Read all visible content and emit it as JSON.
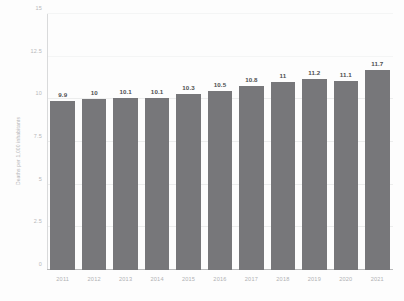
{
  "chart_data": {
    "type": "bar",
    "title": "",
    "subtitle": "",
    "xlabel": "",
    "ylabel": "Deaths per 1,000 inhabitants",
    "categories": [
      "2011",
      "2012",
      "2013",
      "2014",
      "2015",
      "2016",
      "2017",
      "2018",
      "2019",
      "2020",
      "2021"
    ],
    "values": [
      9.9,
      10,
      10.1,
      10.1,
      10.3,
      10.5,
      10.8,
      11,
      11.2,
      11.1,
      11.7
    ],
    "value_labels": [
      "9.9",
      "10",
      "10.1",
      "10.1",
      "10.3",
      "10.5",
      "10.8",
      "11",
      "11.2",
      "11.1",
      "11.7"
    ],
    "ylim": [
      0,
      15
    ],
    "yticks": [
      0,
      2.5,
      5,
      7.5,
      10,
      12.5,
      15
    ],
    "ytick_labels": [
      "0",
      "2.5",
      "5",
      "7.5",
      "10",
      "12.5",
      "15"
    ],
    "grid": true,
    "legend": null,
    "legend_position": "none",
    "series": [
      {
        "name": "Deaths per 1,000 inhabitants",
        "values": [
          9.9,
          10,
          10.1,
          10.1,
          10.3,
          10.5,
          10.8,
          11,
          11.2,
          11.1,
          11.7
        ]
      }
    ],
    "colors": {
      "bar": "#77777a",
      "value_label": "#4d4e50",
      "tick_label": "#b5b6b8",
      "axis": "#b9babb",
      "grid": "#eceded",
      "background": "#fdfdfd"
    }
  }
}
